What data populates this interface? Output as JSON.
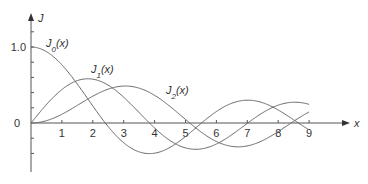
{
  "chart_data": {
    "type": "line",
    "title": "",
    "xlabel": "x",
    "ylabel": "J",
    "xlim": [
      0,
      10
    ],
    "ylim": [
      -0.55,
      1.4
    ],
    "x_ticks": [
      "1",
      "2",
      "3",
      "4",
      "5",
      "6",
      "7",
      "8",
      "9"
    ],
    "y_tick_labels": [
      {
        "value": 1.0,
        "label": "1.0"
      },
      {
        "value": 0,
        "label": "0"
      }
    ],
    "grid": false,
    "series": [
      {
        "name": "J0(x)",
        "sub": "0",
        "function": "bessel_j0",
        "x_range": [
          0,
          9
        ]
      },
      {
        "name": "J1(x)",
        "sub": "1",
        "function": "bessel_j1",
        "x_range": [
          0,
          9
        ]
      },
      {
        "name": "J2(x)",
        "sub": "2",
        "function": "bessel_j2",
        "x_range": [
          0,
          9
        ]
      }
    ]
  }
}
